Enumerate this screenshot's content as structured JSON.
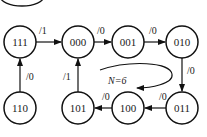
{
  "diagram": {
    "type": "state-transition",
    "title_partial": "",
    "states": [
      {
        "id": "s111",
        "label": "111",
        "cx": 20,
        "cy": 42
      },
      {
        "id": "s000",
        "label": "000",
        "cx": 78,
        "cy": 42
      },
      {
        "id": "s001",
        "label": "001",
        "cx": 128,
        "cy": 42
      },
      {
        "id": "s010",
        "label": "010",
        "cx": 182,
        "cy": 42
      },
      {
        "id": "s110",
        "label": "110",
        "cx": 20,
        "cy": 108
      },
      {
        "id": "s101",
        "label": "101",
        "cx": 78,
        "cy": 108
      },
      {
        "id": "s100",
        "label": "100",
        "cx": 128,
        "cy": 108
      },
      {
        "id": "s011",
        "label": "011",
        "cx": 182,
        "cy": 108
      }
    ],
    "transitions": [
      {
        "from": "111",
        "to": "000",
        "label": "/1"
      },
      {
        "from": "000",
        "to": "001",
        "label": "/0"
      },
      {
        "from": "001",
        "to": "010",
        "label": "/0"
      },
      {
        "from": "010",
        "to": "011",
        "label": "/0"
      },
      {
        "from": "011",
        "to": "100",
        "label": "/0"
      },
      {
        "from": "100",
        "to": "101",
        "label": "/0"
      },
      {
        "from": "101",
        "to": "000",
        "label": "/1"
      },
      {
        "from": "110",
        "to": "111",
        "label": "/0"
      }
    ],
    "annotation": "N=6"
  }
}
